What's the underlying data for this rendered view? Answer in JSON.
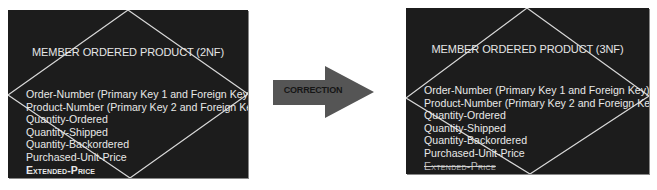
{
  "left_entity": {
    "title": "MEMBER ORDERED PRODUCT (2NF)",
    "attributes": [
      {
        "label": "Order-Number (Primary Key 1 and Foreign Key)",
        "style": "normal"
      },
      {
        "label": "Product-Number (Primary Key 2 and Foreign Key)",
        "style": "normal"
      },
      {
        "label": "Quantity-Ordered",
        "style": "normal"
      },
      {
        "label": "Quantity-Shipped",
        "style": "normal"
      },
      {
        "label": "Quantity-Backordered",
        "style": "normal"
      },
      {
        "label": "Purchased-Unit-Price",
        "style": "normal"
      },
      {
        "label": "Extended-Price",
        "style": "derived-bold"
      }
    ]
  },
  "arrow": {
    "label": "CORRECTION",
    "color": "#555555"
  },
  "right_entity": {
    "title": "MEMBER ORDERED PRODUCT (3NF)",
    "attributes": [
      {
        "label": "Order-Number (Primary Key 1 and Foreign Key)",
        "style": "normal"
      },
      {
        "label": "Product-Number (Primary Key 2 and Foreign Key)",
        "style": "normal"
      },
      {
        "label": "Quantity-Ordered",
        "style": "normal"
      },
      {
        "label": "Quantity-Shipped",
        "style": "normal"
      },
      {
        "label": "Quantity-Backordered",
        "style": "normal"
      },
      {
        "label": "Purchased-Unit-Price",
        "style": "normal"
      },
      {
        "label": "Extended-Price",
        "style": "struck-through"
      }
    ]
  },
  "colors": {
    "entity_background": "#1c1c1c",
    "entity_text": "#e8e8e8",
    "diamond_stroke": "#d8d8d8",
    "arrow_fill": "#555555",
    "arrow_text": "#151515"
  }
}
